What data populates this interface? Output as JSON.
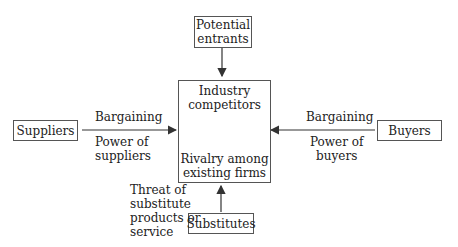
{
  "diagram": {
    "nodes": {
      "entrants": "Potential\nentrants",
      "center_top": "Industry\ncompetitors",
      "center_bottom": "Rivalry among\nexisting firms",
      "suppliers": "Suppliers",
      "buyers": "Buyers",
      "substitutes": "Substitutes"
    },
    "edges": {
      "suppliers_top": "Bargaining",
      "suppliers_bottom": "Power of\nsuppliers",
      "buyers_top": "Bargaining",
      "buyers_bottom": "Power of\nbuyers",
      "substitutes": "Threat of\nsubstitute\nproducts or\nservice"
    },
    "line_color": "#333333"
  }
}
